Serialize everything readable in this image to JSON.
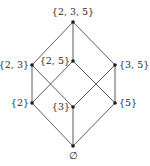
{
  "diagram": {
    "type": "hasse-diagram",
    "colors": {
      "edge": "#4a4a4a",
      "node": "#1a1a1a",
      "text": "#2a2a2a",
      "background": "#ffffff"
    },
    "nodes": [
      {
        "id": "n235",
        "label": "{2, 3, 5}",
        "x": 73,
        "y": 22,
        "lx": 73,
        "ly": 15,
        "anchor": "middle"
      },
      {
        "id": "n23",
        "label": "{2, 3}",
        "x": 32,
        "y": 65,
        "lx": 29,
        "ly": 68,
        "anchor": "end"
      },
      {
        "id": "n25",
        "label": "{2, 5}",
        "x": 73,
        "y": 61,
        "lx": 70,
        "ly": 64,
        "anchor": "end"
      },
      {
        "id": "n35",
        "label": "{3, 5}",
        "x": 115,
        "y": 65,
        "lx": 119,
        "ly": 68,
        "anchor": "start"
      },
      {
        "id": "n2",
        "label": "{2}",
        "x": 32,
        "y": 103,
        "lx": 29,
        "ly": 106,
        "anchor": "end"
      },
      {
        "id": "n3",
        "label": "{3}",
        "x": 73,
        "y": 107,
        "lx": 70,
        "ly": 110,
        "anchor": "end"
      },
      {
        "id": "n5",
        "label": "{5}",
        "x": 115,
        "y": 103,
        "lx": 119,
        "ly": 106,
        "anchor": "start"
      },
      {
        "id": "nempty",
        "label": "∅",
        "x": 73,
        "y": 146,
        "lx": 73,
        "ly": 159,
        "anchor": "middle"
      }
    ],
    "edges": [
      [
        "n235",
        "n23"
      ],
      [
        "n235",
        "n25"
      ],
      [
        "n235",
        "n35"
      ],
      [
        "n23",
        "n2"
      ],
      [
        "n23",
        "n3"
      ],
      [
        "n25",
        "n2"
      ],
      [
        "n25",
        "n5"
      ],
      [
        "n35",
        "n3"
      ],
      [
        "n35",
        "n5"
      ],
      [
        "n2",
        "nempty"
      ],
      [
        "n3",
        "nempty"
      ],
      [
        "n5",
        "nempty"
      ]
    ]
  }
}
